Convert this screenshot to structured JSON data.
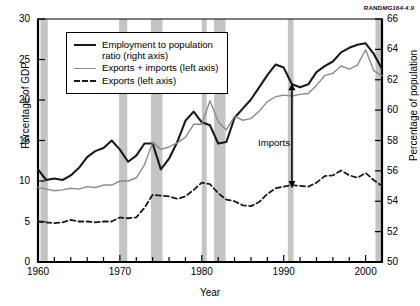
{
  "credit": {
    "brand": "RAND",
    "code": "MG164-4.9"
  },
  "chart_data": {
    "type": "line",
    "title": "",
    "xlabel": "Year",
    "ylabel": "Percentage of GDP",
    "ylabel_right": "Percentage of population",
    "xlim": [
      1960,
      2002
    ],
    "ylim": [
      0,
      30
    ],
    "ylim_right": [
      50,
      66
    ],
    "xticks": [
      1960,
      1970,
      1980,
      1990,
      2000
    ],
    "xtick_labels": [
      "1960",
      "1970",
      "1980",
      "1990",
      "2000"
    ],
    "xminor_step": 2,
    "yticks": [
      0,
      5,
      10,
      15,
      20,
      25,
      30
    ],
    "ytick_labels": [
      "0",
      "5",
      "10",
      "15",
      "20",
      "25",
      "30"
    ],
    "yticks_right": [
      50,
      52,
      54,
      56,
      58,
      60,
      62,
      64,
      66
    ],
    "ytick_labels_right": [
      "50",
      "52",
      "54",
      "56",
      "58",
      "60",
      "62",
      "64",
      "66"
    ],
    "grid": false,
    "legend_position": "upper-left",
    "legend": [
      {
        "label": "Employment to population ratio (right axis)",
        "key": "solid-black",
        "color": "#1a1a1a"
      },
      {
        "label": "Exports + imports (left axis)",
        "key": "solid-gray",
        "color": "#8c8c8c"
      },
      {
        "label": "Exports (left axis)",
        "key": "dashed-black",
        "color": "#1a1a1a"
      }
    ],
    "annotations": [
      {
        "text": "Imports",
        "x": 1991,
        "y_top": 22.0,
        "y_bottom": 9.2,
        "arrow": "double-headed"
      }
    ],
    "recession_bands": [
      {
        "start": 1960.3,
        "end": 1961.2
      },
      {
        "start": 1969.9,
        "end": 1970.9
      },
      {
        "start": 1973.8,
        "end": 1975.2
      },
      {
        "start": 1980.0,
        "end": 1980.6
      },
      {
        "start": 1981.5,
        "end": 1982.9
      },
      {
        "start": 1990.5,
        "end": 1991.2
      },
      {
        "start": 2001.2,
        "end": 2001.9
      }
    ],
    "band_color": "#c4c4c4",
    "x": [
      1960,
      1961,
      1962,
      1963,
      1964,
      1965,
      1966,
      1967,
      1968,
      1969,
      1970,
      1971,
      1972,
      1973,
      1974,
      1975,
      1976,
      1977,
      1978,
      1979,
      1980,
      1981,
      1982,
      1983,
      1984,
      1985,
      1986,
      1987,
      1988,
      1989,
      1990,
      1991,
      1992,
      1993,
      1994,
      1995,
      1996,
      1997,
      1998,
      1999,
      2000,
      2001,
      2002
    ],
    "series": [
      {
        "name": "Employment to population ratio (right axis)",
        "axis": "right",
        "style": "solid",
        "color": "#1a1a1a",
        "width": 2.1,
        "values": [
          56.1,
          55.4,
          55.5,
          55.4,
          55.7,
          56.2,
          56.9,
          57.3,
          57.5,
          58.0,
          57.4,
          56.6,
          57.0,
          57.8,
          57.8,
          56.1,
          56.8,
          57.9,
          59.3,
          59.9,
          59.2,
          59.0,
          57.8,
          57.9,
          59.5,
          60.1,
          60.7,
          61.5,
          62.3,
          63.0,
          62.8,
          61.7,
          61.5,
          61.7,
          62.5,
          62.9,
          63.2,
          63.8,
          64.1,
          64.3,
          64.4,
          63.7,
          62.7
        ]
      },
      {
        "name": "Exports + imports (left axis)",
        "axis": "left",
        "style": "solid",
        "color": "#8c8c8c",
        "width": 1.4,
        "values": [
          9.2,
          9.0,
          8.8,
          8.9,
          9.1,
          9.0,
          9.3,
          9.2,
          9.5,
          9.5,
          10.0,
          10.0,
          10.4,
          12.0,
          14.8,
          13.9,
          14.2,
          14.7,
          15.4,
          17.0,
          17.0,
          19.9,
          17.3,
          16.3,
          18.0,
          17.5,
          17.7,
          18.6,
          19.8,
          20.4,
          20.6,
          20.5,
          20.7,
          20.8,
          21.8,
          23.0,
          23.3,
          24.2,
          23.8,
          24.3,
          26.2,
          23.6,
          23.0
        ]
      },
      {
        "name": "Exports (left axis)",
        "axis": "left",
        "style": "dashed",
        "color": "#1a1a1a",
        "width": 1.8,
        "values": [
          5.0,
          4.9,
          4.8,
          4.9,
          5.2,
          5.0,
          5.0,
          4.9,
          5.0,
          5.0,
          5.5,
          5.4,
          5.5,
          6.7,
          8.3,
          8.2,
          8.1,
          7.8,
          8.1,
          8.9,
          9.8,
          9.6,
          8.5,
          7.7,
          7.5,
          7.0,
          6.9,
          7.4,
          8.4,
          9.1,
          9.3,
          9.5,
          9.4,
          9.3,
          9.8,
          10.6,
          10.7,
          11.3,
          10.7,
          10.4,
          11.0,
          10.1,
          9.4
        ]
      }
    ]
  }
}
